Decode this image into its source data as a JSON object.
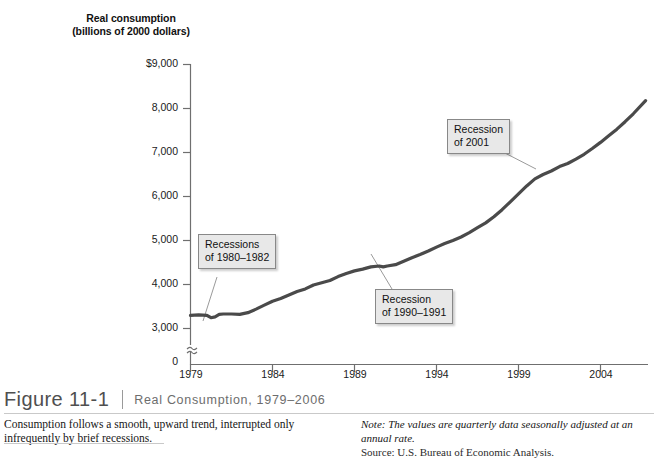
{
  "figure": {
    "number": "Figure 11-1",
    "title": "Real Consumption, 1979–2006",
    "caption": "Consumption follows a smooth, upward trend, interrupted only infrequently by brief recessions.",
    "note": "Note: The values are quarterly data seasonally adjusted at an annual rate.",
    "source": "Source: U.S. Bureau of Economic Analysis."
  },
  "axis_title": {
    "line1": "Real consumption",
    "line2": "(billions of 2000 dollars)"
  },
  "annotations": [
    {
      "id": "recessions-1980-1982",
      "line1": "Recessions",
      "line2": "of 1980–1982"
    },
    {
      "id": "recession-1990-1991",
      "line1": "Recession",
      "line2": "of 1990–1991"
    },
    {
      "id": "recession-2001",
      "line1": "Recession",
      "line2": "of 2001"
    }
  ],
  "chart_data": {
    "type": "line",
    "title": "Real Consumption, 1979–2006",
    "xlabel": "",
    "ylabel": "Real consumption (billions of 2000 dollars)",
    "xlim": [
      1979,
      2006.75
    ],
    "ylim": [
      2800,
      9000
    ],
    "ytick_labels": [
      "$9,000",
      "8,000",
      "7,000",
      "6,000",
      "5,000",
      "4,000",
      "3,000",
      "0"
    ],
    "yticks": [
      9000,
      8000,
      7000,
      6000,
      5000,
      4000,
      3000,
      0
    ],
    "xticks": [
      1979,
      1984,
      1989,
      1994,
      1999,
      2004
    ],
    "xtick_labels": [
      "1979",
      "1984",
      "1989",
      "1994",
      "1999",
      "2004"
    ],
    "axis_break": true,
    "axis_break_between": [
      0,
      3000
    ],
    "grid": false,
    "legend": false,
    "line_color": "#4a4a4a",
    "line_width": 3.2,
    "series": [
      {
        "name": "Real consumption",
        "x": [
          1979.0,
          1979.5,
          1980.0,
          1980.25,
          1980.5,
          1980.75,
          1981.0,
          1981.5,
          1982.0,
          1982.5,
          1983.0,
          1983.5,
          1984.0,
          1984.5,
          1985.0,
          1985.5,
          1986.0,
          1986.5,
          1987.0,
          1987.5,
          1988.0,
          1988.5,
          1989.0,
          1989.5,
          1990.0,
          1990.5,
          1990.75,
          1991.0,
          1991.5,
          1992.0,
          1992.5,
          1993.0,
          1993.5,
          1994.0,
          1994.5,
          1995.0,
          1995.5,
          1996.0,
          1996.5,
          1997.0,
          1997.5,
          1998.0,
          1998.5,
          1999.0,
          1999.5,
          2000.0,
          2000.5,
          2001.0,
          2001.5,
          2002.0,
          2002.5,
          2003.0,
          2003.5,
          2004.0,
          2004.5,
          2005.0,
          2005.5,
          2006.0,
          2006.75
        ],
        "y": [
          3300,
          3310,
          3300,
          3245,
          3265,
          3320,
          3330,
          3330,
          3320,
          3360,
          3440,
          3530,
          3620,
          3680,
          3760,
          3840,
          3900,
          3990,
          4040,
          4090,
          4180,
          4250,
          4310,
          4350,
          4400,
          4420,
          4400,
          4420,
          4450,
          4530,
          4610,
          4680,
          4760,
          4850,
          4930,
          5000,
          5080,
          5180,
          5290,
          5400,
          5540,
          5700,
          5880,
          6060,
          6240,
          6400,
          6500,
          6580,
          6680,
          6750,
          6850,
          6960,
          7090,
          7230,
          7380,
          7530,
          7700,
          7880,
          8180
        ]
      }
    ]
  }
}
